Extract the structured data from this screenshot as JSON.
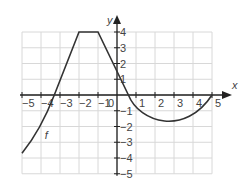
{
  "chart_data": {
    "type": "line",
    "title": "",
    "xlabel": "x",
    "ylabel": "y",
    "xlim": [
      -5,
      5
    ],
    "ylim": [
      -5,
      4
    ],
    "grid": true,
    "x_ticks": [
      "-5",
      "-4",
      "-3",
      "-2",
      "-1",
      "0",
      "1",
      "2",
      "3",
      "4",
      "5"
    ],
    "y_ticks": [
      "4",
      "3",
      "2",
      "1",
      "-1",
      "-2",
      "-3",
      "-4",
      "-5"
    ],
    "series": [
      {
        "name": "f",
        "label_position": {
          "x": -3.8,
          "y": -2.8
        },
        "points": [
          {
            "x": -5,
            "y": -3.7
          },
          {
            "x": -4,
            "y": -2
          },
          {
            "x": -3.3,
            "y": 0
          },
          {
            "x": -2,
            "y": 4
          },
          {
            "x": -1,
            "y": 4
          },
          {
            "x": 0,
            "y": 2
          },
          {
            "x": 0.6,
            "y": 0
          },
          {
            "x": 1,
            "y": -0.8
          },
          {
            "x": 2,
            "y": -1.6
          },
          {
            "x": 3,
            "y": -1.8
          },
          {
            "x": 4,
            "y": -1.4
          },
          {
            "x": 4.8,
            "y": -0.4
          },
          {
            "x": 5,
            "y": 0
          }
        ]
      }
    ],
    "colors": {
      "curve": "#333333",
      "grid": "#d8d8d8",
      "axis": "#222222"
    }
  }
}
